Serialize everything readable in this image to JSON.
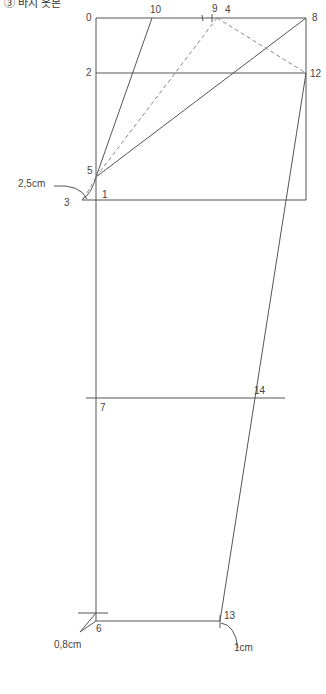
{
  "caption": "③ 바지 옷본",
  "colors": {
    "line": "#555555",
    "dashed": "#888888",
    "label": "#444444"
  },
  "labels": {
    "p0": "0",
    "p1": "1",
    "p2": "2",
    "p3": "3",
    "p4": "4",
    "p5": "5",
    "p6": "6",
    "p7": "7",
    "p8": "8",
    "p9": "9",
    "p10": "10",
    "p12": "12",
    "p13": "13",
    "p14": "14"
  },
  "annotations": {
    "crotch_ext": "2,5cm",
    "hem_in": "0,8cm",
    "hem_out": "1cm"
  }
}
